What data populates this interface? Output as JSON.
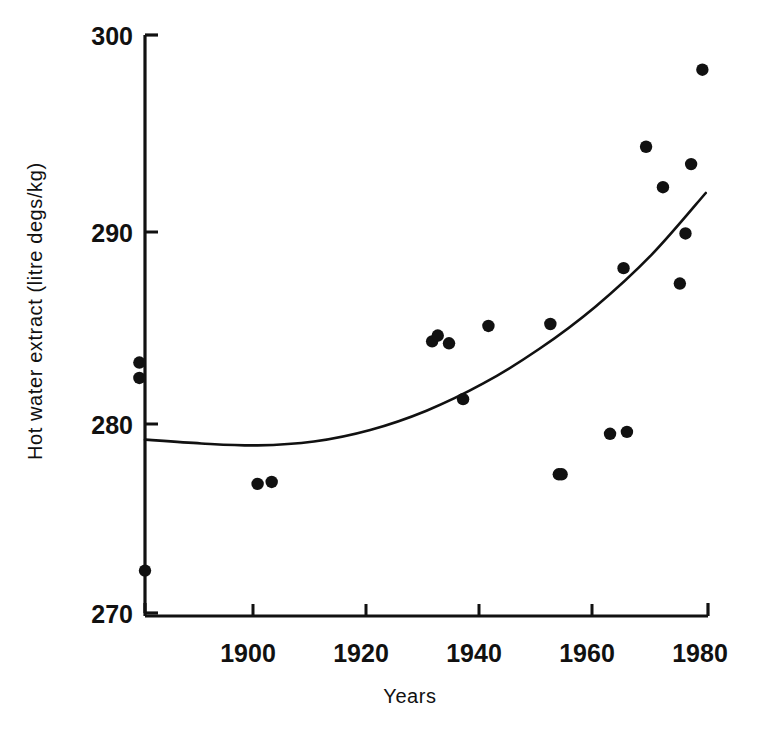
{
  "chart_data": {
    "type": "scatter",
    "title": "",
    "xlabel": "Years",
    "ylabel": "Hot water extract (litre degs/kg)",
    "xlim": [
      1880,
      1980
    ],
    "ylim": [
      270,
      300
    ],
    "xticks": [
      1880,
      1900,
      1920,
      1940,
      1960,
      1980
    ],
    "xtick_labels": [
      "",
      "1900",
      "1920",
      "1940",
      "1960",
      "1980"
    ],
    "yticks": [
      270,
      280,
      290,
      300
    ],
    "ytick_labels": [
      "270",
      "280",
      "290",
      "300"
    ],
    "grid": false,
    "legend": "none",
    "series": [
      {
        "name": "Hot water extract observations",
        "type": "scatter",
        "marker": "filled-circle",
        "color": "#111111",
        "points": [
          {
            "x": 1879.0,
            "y": 283.0
          },
          {
            "x": 1879.0,
            "y": 282.2
          },
          {
            "x": 1880.0,
            "y": 272.2
          },
          {
            "x": 1900.0,
            "y": 276.7
          },
          {
            "x": 1902.5,
            "y": 276.8
          },
          {
            "x": 1931.0,
            "y": 284.1
          },
          {
            "x": 1932.0,
            "y": 284.4
          },
          {
            "x": 1934.0,
            "y": 284.0
          },
          {
            "x": 1936.5,
            "y": 281.1
          },
          {
            "x": 1941.0,
            "y": 284.9
          },
          {
            "x": 1952.0,
            "y": 285.0
          },
          {
            "x": 1953.5,
            "y": 277.2
          },
          {
            "x": 1954.0,
            "y": 277.2
          },
          {
            "x": 1962.6,
            "y": 279.3
          },
          {
            "x": 1965.0,
            "y": 287.9
          },
          {
            "x": 1965.6,
            "y": 279.4
          },
          {
            "x": 1969.0,
            "y": 294.2
          },
          {
            "x": 1972.0,
            "y": 292.1
          },
          {
            "x": 1975.0,
            "y": 287.1
          },
          {
            "x": 1976.0,
            "y": 289.7
          },
          {
            "x": 1977.0,
            "y": 293.3
          },
          {
            "x": 1979.0,
            "y": 298.2
          }
        ]
      },
      {
        "name": "Fitted trend curve",
        "type": "line",
        "color": "#111111",
        "points": [
          {
            "x": 1880.0,
            "y": 279.0
          },
          {
            "x": 1890.0,
            "y": 278.8
          },
          {
            "x": 1900.0,
            "y": 278.7
          },
          {
            "x": 1910.0,
            "y": 278.9
          },
          {
            "x": 1920.0,
            "y": 279.5
          },
          {
            "x": 1930.0,
            "y": 280.5
          },
          {
            "x": 1940.0,
            "y": 281.9
          },
          {
            "x": 1950.0,
            "y": 283.7
          },
          {
            "x": 1960.0,
            "y": 285.9
          },
          {
            "x": 1970.0,
            "y": 288.6
          },
          {
            "x": 1979.6,
            "y": 291.8
          }
        ]
      }
    ]
  },
  "axes": {
    "y_axis_label": "Hot water extract (litre degs/kg)",
    "x_axis_label": "Years",
    "y_tick_300": "300",
    "y_tick_290": "290",
    "y_tick_280": "280",
    "y_tick_270": "270",
    "x_tick_1900": "1900",
    "x_tick_1920": "1920",
    "x_tick_1940": "1940",
    "x_tick_1960": "1960",
    "x_tick_1980": "1980"
  },
  "style": {
    "ink_color": "#111111",
    "background_color": "#ffffff"
  }
}
